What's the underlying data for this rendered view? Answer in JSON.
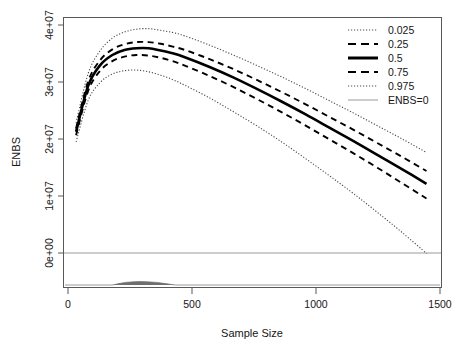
{
  "chart": {
    "type": "line",
    "title": "",
    "xlabel": "Sample Size",
    "ylabel": "ENBS",
    "x_ticks": [
      "0",
      "500",
      "1000",
      "1500"
    ],
    "x_tick_values": [
      0,
      500,
      1000,
      1500
    ],
    "y_ticks": [
      "0e+00",
      "1e+07",
      "2e+07",
      "3e+07",
      "4e+07"
    ],
    "y_tick_values": [
      0,
      10000000,
      20000000,
      30000000,
      40000000
    ],
    "xlim": [
      0,
      1560
    ],
    "ylim": [
      -6500000,
      41500000
    ],
    "grid": false,
    "legend_position": "top-right"
  },
  "legend": {
    "entries": [
      {
        "label": "0.025",
        "style": "dotted",
        "color": "#4a4a4a"
      },
      {
        "label": "0.25",
        "style": "dashed",
        "color": "#000000"
      },
      {
        "label": "0.5",
        "style": "solid-thick",
        "color": "#000000"
      },
      {
        "label": "0.75",
        "style": "dashed",
        "color": "#000000"
      },
      {
        "label": "0.975",
        "style": "dotted",
        "color": "#4a4a4a"
      },
      {
        "label": "ENBS=0",
        "style": "solid-thin",
        "color": "#9a9a9a"
      }
    ]
  },
  "chart_data": {
    "type": "line",
    "title": "",
    "xlabel": "Sample Size",
    "ylabel": "ENBS",
    "xlim": [
      0,
      1560
    ],
    "ylim": [
      -6500000,
      41500000
    ],
    "x_ticks": [
      0,
      500,
      1000,
      1500
    ],
    "y_ticks": [
      0,
      10000000,
      20000000,
      30000000,
      40000000
    ],
    "y_tick_labels": [
      "0e+00",
      "1e+07",
      "2e+07",
      "3e+07",
      "4e+07"
    ],
    "grid": false,
    "legend_position": "top-right",
    "x": [
      50,
      100,
      150,
      200,
      250,
      300,
      350,
      400,
      450,
      500,
      600,
      700,
      800,
      900,
      1000,
      1100,
      1200,
      1300,
      1400,
      1500
    ],
    "series": [
      {
        "name": "0.025",
        "style": "dotted",
        "color": "#4a4a4a",
        "values": [
          22800000,
          31600000,
          35700000,
          37900000,
          39000000,
          39500000,
          39600000,
          39300000,
          38900000,
          38300000,
          36700000,
          34900000,
          33000000,
          31000000,
          28900000,
          26700000,
          24500000,
          22200000,
          19900000,
          17500000
        ]
      },
      {
        "name": "0.25",
        "style": "dashed",
        "color": "#000000",
        "values": [
          21800000,
          30200000,
          34000000,
          35900000,
          36800000,
          37200000,
          37200000,
          36900000,
          36400000,
          35800000,
          34200000,
          32400000,
          30400000,
          28300000,
          26100000,
          23800000,
          21500000,
          19100000,
          16700000,
          14200000
        ]
      },
      {
        "name": "0.5",
        "style": "solid-thick",
        "color": "#000000",
        "values": [
          21200000,
          29400000,
          33100000,
          34900000,
          35800000,
          36100000,
          36100000,
          35700000,
          35200000,
          34500000,
          32800000,
          30900000,
          28800000,
          26600000,
          24300000,
          21900000,
          19500000,
          17000000,
          14500000,
          11900000
        ]
      },
      {
        "name": "0.75",
        "style": "dashed",
        "color": "#000000",
        "values": [
          20600000,
          28500000,
          32100000,
          33800000,
          34600000,
          34900000,
          34800000,
          34400000,
          33800000,
          33000000,
          31200000,
          29200000,
          27000000,
          24700000,
          22300000,
          19800000,
          17300000,
          14700000,
          12000000,
          9300000
        ]
      },
      {
        "name": "0.975",
        "style": "dotted",
        "color": "#4a4a4a",
        "values": [
          19400000,
          26800000,
          30000000,
          31500000,
          32100000,
          32200000,
          31900000,
          31300000,
          30500000,
          29500000,
          27300000,
          24800000,
          22200000,
          19400000,
          16400000,
          13300000,
          10100000,
          6700000,
          3200000,
          -500000
        ]
      },
      {
        "name": "ENBS=0",
        "style": "solid-thin",
        "color": "#9a9a9a",
        "constant_y": 0
      }
    ],
    "rug": {
      "description": "sample-size density strip along bottom axis",
      "x_range": [
        200,
        460
      ],
      "peak_x": 300
    }
  }
}
